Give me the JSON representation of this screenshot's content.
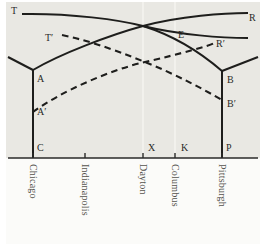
{
  "figure": {
    "background_color": "#e9e8e3",
    "line_color": "#1e1e1c",
    "axis_color": "#2a2a28",
    "gridline_color": "#f4f3ef",
    "label_color": "#55534e"
  },
  "chart_data": {
    "type": "line",
    "title": "",
    "xlabel": "",
    "ylabel": "",
    "grid": true,
    "legend_position": "none",
    "xlim": [
      0,
      270
    ],
    "ylim": [
      158,
      0
    ],
    "axis": {
      "name": "baseline",
      "y": 158,
      "x_start": 8,
      "x_end": 258
    },
    "cities": [
      {
        "name": "Chicago",
        "x": 33,
        "tick": true
      },
      {
        "name": "Indianapolis",
        "x": 85,
        "tick": true
      },
      {
        "name": "Dayton",
        "x": 143,
        "tick": true
      },
      {
        "name": "Columbus",
        "x": 175,
        "tick": true
      },
      {
        "name": "Pittsburgh",
        "x": 222,
        "tick": true
      }
    ],
    "gridlines_x": [
      143,
      175
    ],
    "point_labels": [
      {
        "id": "T",
        "text": "T",
        "x": 11,
        "y": 6
      },
      {
        "id": "R",
        "text": "R",
        "x": 249,
        "y": 13
      },
      {
        "id": "Tp",
        "text": "T′",
        "x": 45,
        "y": 33
      },
      {
        "id": "Rp",
        "text": "R′",
        "x": 216,
        "y": 39
      },
      {
        "id": "E",
        "text": "E",
        "x": 178,
        "y": 30
      },
      {
        "id": "A",
        "text": "A",
        "x": 37,
        "y": 74
      },
      {
        "id": "B",
        "text": "B",
        "x": 227,
        "y": 75
      },
      {
        "id": "Ap",
        "text": "A′",
        "x": 37,
        "y": 107
      },
      {
        "id": "Bp",
        "text": "B′",
        "x": 227,
        "y": 99
      },
      {
        "id": "C",
        "text": "C",
        "x": 37,
        "y": 143
      },
      {
        "id": "X",
        "text": "X",
        "x": 148,
        "y": 143
      },
      {
        "id": "K",
        "text": "K",
        "x": 181,
        "y": 143
      },
      {
        "id": "P",
        "text": "P",
        "x": 226,
        "y": 143
      }
    ],
    "series": [
      {
        "name": "T-to-R solid curve",
        "style": "solid",
        "path": "M 22,14 C 70,13 120,20 143,26 C 180,35 222,38 248,38"
      },
      {
        "name": "A-to-R rising solid curve",
        "style": "solid",
        "path": "M 33,70 C 60,54 110,35 143,26 C 180,16 225,13 248,13"
      },
      {
        "name": "left vertical riser C-to-A",
        "style": "solid",
        "path": "M 33,158 L 33,70"
      },
      {
        "name": "left branch arm",
        "style": "solid",
        "path": "M 8,57 L 33,70"
      },
      {
        "name": "right vertical riser P-to-B",
        "style": "solid",
        "path": "M 222,158 L 222,71"
      },
      {
        "name": "right branch arm",
        "style": "solid",
        "path": "M 258,57 L 222,71"
      },
      {
        "name": "B-to-left solid curve",
        "style": "solid",
        "path": "M 222,71 C 200,52 175,36 143,26"
      },
      {
        "name": "T-prime dashed descending curve",
        "style": "dashed",
        "path": "M 62,35 C 95,42 125,54 145,62 C 175,74 205,90 222,100"
      },
      {
        "name": "A-prime dashed ascending curve",
        "style": "dashed",
        "path": "M 33,112 C 60,92 110,70 145,62 C 180,54 212,45 214,43"
      }
    ]
  }
}
